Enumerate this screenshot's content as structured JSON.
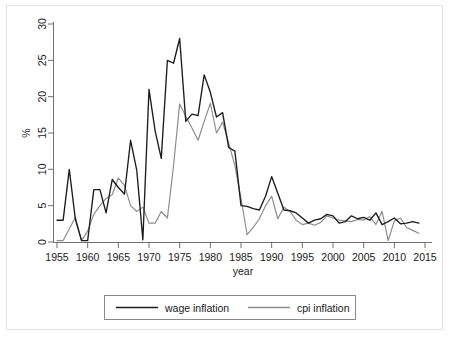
{
  "chart_data": {
    "type": "line",
    "title": "",
    "xlabel": "year",
    "ylabel": "%",
    "xlim": [
      1955,
      2015
    ],
    "ylim": [
      0,
      30
    ],
    "xticks": [
      1955,
      1960,
      1965,
      1970,
      1975,
      1980,
      1985,
      1990,
      1995,
      2000,
      2005,
      2010,
      2015
    ],
    "yticks": [
      0,
      5,
      10,
      15,
      20,
      25,
      30
    ],
    "grid": false,
    "legend_position": "below-plot",
    "x": [
      1955,
      1956,
      1957,
      1958,
      1959,
      1960,
      1961,
      1962,
      1963,
      1964,
      1965,
      1966,
      1967,
      1968,
      1969,
      1970,
      1971,
      1972,
      1973,
      1974,
      1975,
      1976,
      1977,
      1978,
      1979,
      1980,
      1981,
      1982,
      1983,
      1984,
      1985,
      1986,
      1987,
      1988,
      1989,
      1990,
      1991,
      1992,
      1993,
      1994,
      1995,
      1996,
      1997,
      1998,
      1999,
      2000,
      2001,
      2002,
      2003,
      2004,
      2005,
      2006,
      2007,
      2008,
      2009,
      2010,
      2011,
      2012,
      2013,
      2014
    ],
    "series": [
      {
        "name": "wage inflation",
        "color": "#1c1c1c",
        "values": [
          3.0,
          3.0,
          10.0,
          3.1,
          0.2,
          0.2,
          7.2,
          7.2,
          4.0,
          8.6,
          7.5,
          6.6,
          14.0,
          9.9,
          0.3,
          21.0,
          15.3,
          11.5,
          25.0,
          24.6,
          28.0,
          16.6,
          17.6,
          17.4,
          23.0,
          20.6,
          17.2,
          17.8,
          13.0,
          12.5,
          5.0,
          4.9,
          4.6,
          4.4,
          6.3,
          9.0,
          6.7,
          4.4,
          4.3,
          4.0,
          3.3,
          2.6,
          3.0,
          3.2,
          3.8,
          3.6,
          2.6,
          2.8,
          3.6,
          3.2,
          3.4,
          3.0,
          4.0,
          2.4,
          2.8,
          3.3,
          2.5,
          2.6,
          2.8,
          2.6
        ]
      },
      {
        "name": "cpi inflation",
        "color": "#8e8e8e",
        "values": [
          0.2,
          0.2,
          1.8,
          3.4,
          0.2,
          1.5,
          3.8,
          5.0,
          6.0,
          6.5,
          8.8,
          7.8,
          5.0,
          4.2,
          4.8,
          2.6,
          2.6,
          4.2,
          3.3,
          10.5,
          19.0,
          17.3,
          15.7,
          14.0,
          16.6,
          19.1,
          15.0,
          16.5,
          13.6,
          10.5,
          6.0,
          1.0,
          2.0,
          3.2,
          5.0,
          6.3,
          3.2,
          4.8,
          4.2,
          3.0,
          2.4,
          2.6,
          2.3,
          2.7,
          3.6,
          3.3,
          3.0,
          2.9,
          2.8,
          3.1,
          3.0,
          3.5,
          2.4,
          4.2,
          0.2,
          2.9,
          3.3,
          2.0,
          1.6,
          1.2
        ]
      }
    ]
  },
  "axes": {
    "x_title": "year",
    "y_title": "%",
    "x_tick_labels": [
      "1955",
      "1960",
      "1965",
      "1970",
      "1975",
      "1980",
      "1985",
      "1990",
      "1995",
      "2000",
      "2005",
      "2010",
      "2015"
    ],
    "y_tick_labels": [
      "0",
      "5",
      "10",
      "15",
      "20",
      "25",
      "30"
    ]
  },
  "legend": {
    "items": [
      {
        "label": "wage inflation",
        "color": "#1c1c1c",
        "style": "solid-dark"
      },
      {
        "label": "cpi inflation",
        "color": "#8e8e8e",
        "style": "solid-gray"
      }
    ]
  },
  "colors": {
    "background": "#ffffff",
    "frame": "#e3e3e3",
    "axis": "#6f6f6f",
    "text": "#1a1a1a",
    "wage": "#1c1c1c",
    "cpi": "#8e8e8e"
  }
}
